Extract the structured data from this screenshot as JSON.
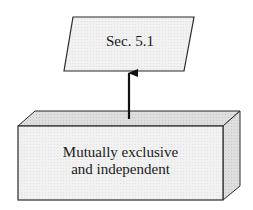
{
  "diagram": {
    "top_node": {
      "shape": "parallelogram",
      "label": "Sec. 5.1"
    },
    "bottom_node": {
      "shape": "3d-box",
      "label_line1": "Mutually exclusive",
      "label_line2": "and independent"
    },
    "edge": {
      "from": "bottom_node",
      "to": "top_node",
      "style": "solid-arrow"
    },
    "colors": {
      "fill": "#efefef",
      "top_face": "#dcdcdc",
      "side_face": "#d4d4d4",
      "stroke": "#2a2a2a"
    }
  }
}
